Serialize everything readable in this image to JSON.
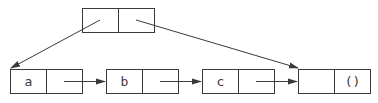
{
  "diagram": {
    "type": "cons-cell-list",
    "stroke_color": "#3a3a3a",
    "background": "#ffffff",
    "head_cell": {
      "car": "",
      "cdr": ""
    },
    "list_cells": [
      {
        "car": "a",
        "cdr": ""
      },
      {
        "car": "b",
        "cdr": ""
      },
      {
        "car": "c",
        "cdr": ""
      },
      {
        "car": "",
        "cdr": "()"
      }
    ]
  }
}
